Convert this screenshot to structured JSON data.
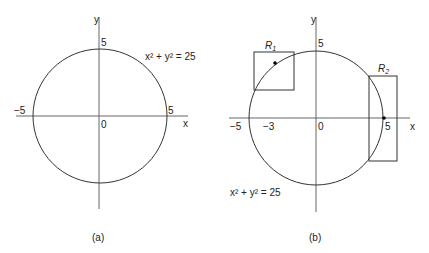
{
  "panels": [
    {
      "id": "a",
      "caption": "(a)",
      "equation": "x² + y² = 25",
      "axis_x": "x",
      "axis_y": "y",
      "origin": "0",
      "ticks": {
        "y_top": "5",
        "x_left": "−5",
        "x_right": "5"
      }
    },
    {
      "id": "b",
      "caption": "(b)",
      "equation": "x² + y² = 25",
      "axis_x": "x",
      "axis_y": "y",
      "origin": "0",
      "ticks": {
        "y_top": "5",
        "x_left": "−5",
        "x_minus3": "−3",
        "x_right": "5"
      },
      "regions": [
        {
          "label": "R",
          "sub": "1"
        },
        {
          "label": "R",
          "sub": "2"
        }
      ]
    }
  ]
}
